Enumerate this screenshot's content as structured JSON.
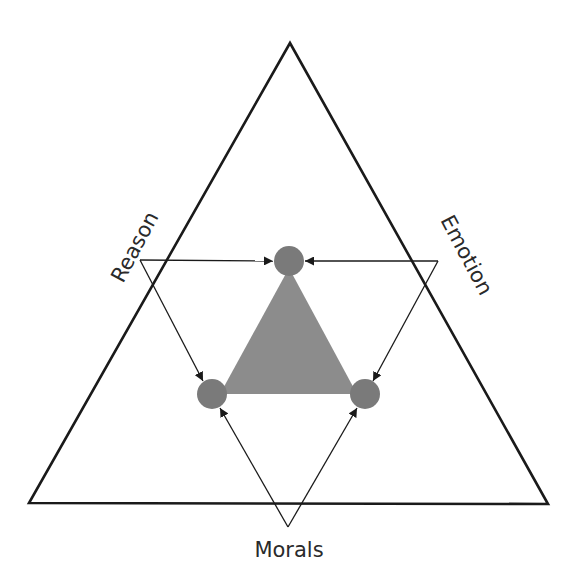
{
  "diagram": {
    "labels": {
      "reason": "Reason",
      "emotion": "Emotion",
      "morals": "Morals"
    },
    "colors": {
      "outline": "#1a1a1a",
      "inner_fill": "#8c8c8c",
      "node_fill": "#7a7a7a",
      "text": "#2a2a2a"
    }
  }
}
